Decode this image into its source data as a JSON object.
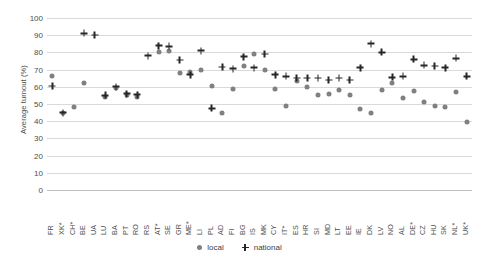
{
  "chart_data": {
    "type": "scatter",
    "title": "",
    "xlabel": "",
    "ylabel": "Average turnout (%)",
    "ylim": [
      0,
      100
    ],
    "yticks": [
      0,
      10,
      20,
      30,
      40,
      50,
      60,
      70,
      80,
      90,
      100
    ],
    "grid": true,
    "legend_position": "bottom-center",
    "categories": [
      "FR",
      "XK*",
      "CH*",
      "BE",
      "UA",
      "LU",
      "BA",
      "PT",
      "RO",
      "RS",
      "AT*",
      "SE",
      "GR",
      "ME*",
      "LI",
      "PL",
      "AD",
      "FI",
      "BG",
      "IS",
      "MK",
      "CY",
      "IT*",
      "ES",
      "HR",
      "SI",
      "MD",
      "LT",
      "EE",
      "IE",
      "DK",
      "LV",
      "NO",
      "AL",
      "DE*",
      "CZ",
      "HU",
      "SK",
      "NL*",
      "UK*"
    ],
    "series": [
      {
        "name": "local",
        "marker": "circle",
        "color": "#808080",
        "values": [
          66,
          45,
          48.5,
          62.5,
          null,
          54,
          59.5,
          55.5,
          54,
          null,
          80.5,
          81,
          68,
          68.5,
          69.5,
          60.5,
          45,
          58.5,
          72,
          79,
          70,
          59,
          49,
          63.5,
          60,
          55.5,
          56,
          58,
          55,
          47,
          44.5,
          58,
          62,
          53.5,
          57.5,
          51,
          49,
          48.5,
          57,
          39.5
        ]
      },
      {
        "name": "national",
        "marker": "cross",
        "color": "#262626",
        "values": [
          60.5,
          45,
          null,
          91,
          90,
          55,
          60,
          56,
          55.5,
          78,
          84,
          83.5,
          75.5,
          67,
          81,
          47.5,
          71.5,
          70.5,
          77.5,
          71,
          79,
          67,
          66,
          65,
          65,
          65,
          64,
          65,
          64,
          71,
          85,
          80,
          65.5,
          66,
          76,
          72.5,
          72,
          71,
          76.5,
          66
        ]
      }
    ],
    "legend": [
      {
        "label": "local",
        "marker": "circle"
      },
      {
        "label": "national",
        "marker": "cross"
      }
    ]
  }
}
